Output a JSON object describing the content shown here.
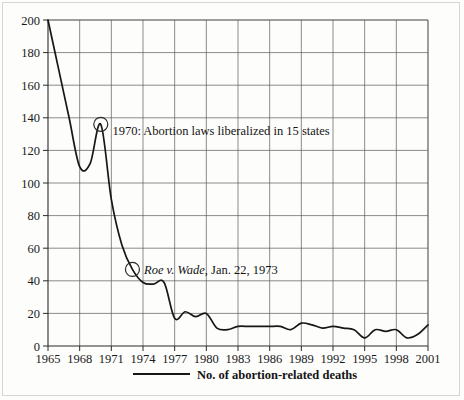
{
  "chart_data": {
    "type": "line",
    "title": "",
    "xlabel": "",
    "ylabel": "",
    "grid": true,
    "legend_position": "bottom",
    "xlim": [
      1965,
      2001
    ],
    "ylim": [
      0,
      200
    ],
    "y_ticks": [
      0,
      20,
      40,
      60,
      80,
      100,
      120,
      140,
      160,
      180,
      200
    ],
    "x_ticks": [
      1965,
      1968,
      1971,
      1974,
      1977,
      1980,
      1983,
      1986,
      1989,
      1992,
      1995,
      1998,
      2001
    ],
    "x_tick_labels": [
      "1965",
      "1968",
      "1971",
      "1974",
      "1977",
      "1980",
      "1983",
      "1986",
      "1989",
      "1992",
      "1995",
      "1998",
      "2001"
    ],
    "y_tick_labels": [
      "0",
      "20",
      "40",
      "60",
      "80",
      "100",
      "120",
      "140",
      "160",
      "180",
      "200"
    ],
    "series": [
      {
        "name": "No. of abortion-related deaths",
        "color": "#171717",
        "x": [
          1965,
          1966,
          1967,
          1968,
          1969,
          1970,
          1971,
          1972,
          1973,
          1974,
          1975,
          1976,
          1977,
          1978,
          1979,
          1980,
          1981,
          1982,
          1983,
          1984,
          1985,
          1986,
          1987,
          1988,
          1989,
          1990,
          1991,
          1992,
          1993,
          1994,
          1995,
          1996,
          1997,
          1998,
          1999,
          2000,
          2001
        ],
        "values": [
          200,
          170,
          140,
          110,
          112,
          136,
          90,
          62,
          47,
          39,
          38,
          39,
          17,
          21,
          18,
          20,
          11,
          10,
          12,
          12,
          12,
          12,
          12,
          10,
          14,
          13,
          11,
          12,
          11,
          10,
          5,
          10,
          9,
          10,
          5,
          7,
          13
        ]
      }
    ],
    "annotations": [
      {
        "id": "annot-1970",
        "marker_x": 1970,
        "marker_y": 136,
        "text": "1970: Abortion laws liberalized in 15 states",
        "italic_prefix": "",
        "text_x": 1971.1,
        "text_y": 132
      },
      {
        "id": "annot-roe",
        "marker_x": 1973,
        "marker_y": 47,
        "text": ", Jan. 22, 1973",
        "italic_prefix": "Roe v. Wade",
        "text_x": 1974.1,
        "text_y": 47
      }
    ],
    "legend": [
      {
        "label": "No. of abortion-related deaths",
        "color": "#171717"
      }
    ]
  }
}
